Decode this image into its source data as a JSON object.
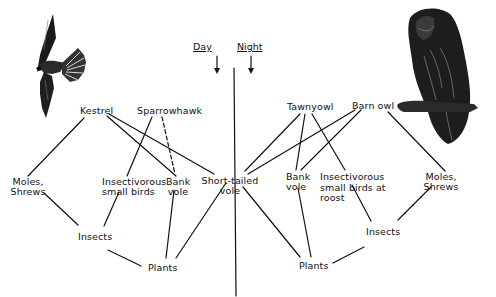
{
  "diagram": {
    "type": "food-web",
    "divider": {
      "labels": {
        "day": "Day",
        "night": "Night"
      }
    },
    "predators": {
      "day": [
        {
          "id": "kestrel",
          "label": "Kestrel"
        },
        {
          "id": "sparrowhawk",
          "label": "Sparrowhawk"
        }
      ],
      "night": [
        {
          "id": "tawny_owl",
          "label": "Tawnyowl"
        },
        {
          "id": "barn_owl",
          "label": "Barn owl"
        }
      ]
    },
    "prey": {
      "moles_left": {
        "line1": "Moles,",
        "line2": "Shrews"
      },
      "insectivorous_left": {
        "line1": "Insectivorous",
        "line2": "small birds"
      },
      "bank_vole_left": {
        "line1": "Bank",
        "line2": "vole"
      },
      "short_tailed_vole": {
        "line1": "Short-tailed",
        "line2": "vole"
      },
      "bank_vole_right": {
        "line1": "Bank",
        "line2": "vole"
      },
      "insectivorous_right": {
        "line1": "Insectivorous",
        "line2": "small birds at",
        "line3": "roost"
      },
      "moles_right": {
        "line1": "Moles,",
        "line2": "Shrews"
      }
    },
    "base": {
      "insects_left": "Insects",
      "plants_left": "Plants",
      "plants_right": "Plants",
      "insects_right": "Insects"
    },
    "illustrations": {
      "left": "kestrel-illustration",
      "right": "owl-illustration"
    },
    "links": [
      {
        "from": "Kestrel",
        "to": "Moles, Shrews (left)",
        "style": "solid"
      },
      {
        "from": "Kestrel",
        "to": "Bank vole (left)",
        "style": "solid"
      },
      {
        "from": "Kestrel",
        "to": "Short-tailed vole",
        "style": "solid"
      },
      {
        "from": "Sparrowhawk",
        "to": "Insectivorous small birds",
        "style": "solid"
      },
      {
        "from": "Sparrowhawk",
        "to": "Bank vole (left)",
        "style": "dashed"
      },
      {
        "from": "Tawnyowl",
        "to": "Short-tailed vole",
        "style": "solid"
      },
      {
        "from": "Tawnyowl",
        "to": "Bank vole (right)",
        "style": "solid"
      },
      {
        "from": "Tawnyowl",
        "to": "Insectivorous small birds at roost",
        "style": "solid"
      },
      {
        "from": "Barn owl",
        "to": "Short-tailed vole",
        "style": "solid"
      },
      {
        "from": "Barn owl",
        "to": "Bank vole (right)",
        "style": "solid"
      },
      {
        "from": "Barn owl",
        "to": "Moles, Shrews (right)",
        "style": "solid"
      },
      {
        "from": "Moles, Shrews (left)",
        "to": "Insects (left)",
        "style": "solid"
      },
      {
        "from": "Insectivorous small birds",
        "to": "Insects (left)",
        "style": "solid"
      },
      {
        "from": "Insects (left)",
        "to": "Plants (left)",
        "style": "solid"
      },
      {
        "from": "Bank vole (left)",
        "to": "Plants (left)",
        "style": "solid"
      },
      {
        "from": "Short-tailed vole",
        "to": "Plants (left)",
        "style": "solid"
      },
      {
        "from": "Short-tailed vole",
        "to": "Plants (right)",
        "style": "solid"
      },
      {
        "from": "Bank vole (right)",
        "to": "Plants (right)",
        "style": "solid"
      },
      {
        "from": "Insectivorous small birds at roost",
        "to": "Insects (right)",
        "style": "solid"
      },
      {
        "from": "Moles, Shrews (right)",
        "to": "Insects (right)",
        "style": "solid"
      },
      {
        "from": "Insects (right)",
        "to": "Plants (right)",
        "style": "solid"
      }
    ]
  }
}
